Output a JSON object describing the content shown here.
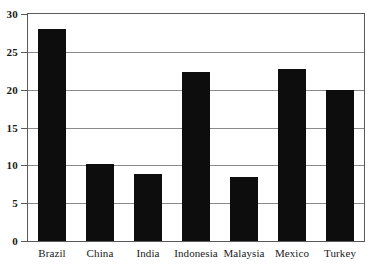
{
  "chart_data": {
    "type": "bar",
    "title": "",
    "subtitle": "",
    "xlabel": "",
    "ylabel": "",
    "categories": [
      "Brazil",
      "China",
      "India",
      "Indonesia",
      "Malaysia",
      "Mexico",
      "Turkey"
    ],
    "values": [
      28.0,
      10.2,
      8.8,
      22.3,
      8.5,
      22.7,
      20.0
    ],
    "ylim": [
      0,
      30
    ],
    "ytick_labels": [
      "30",
      "25",
      "20",
      "15",
      "10",
      "5",
      "0"
    ],
    "ytick_values": [
      30,
      25,
      20,
      15,
      10,
      5,
      0
    ],
    "grid": true,
    "legend": false,
    "legend_position": "none",
    "bar_color": "#0d0d0d",
    "gridline_color": "#8a8a8a",
    "axis_color": "#5a5a5a",
    "background_color": "#ffffff"
  }
}
